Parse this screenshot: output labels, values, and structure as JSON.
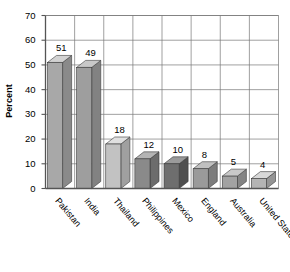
{
  "chart_data": {
    "type": "bar",
    "title": "",
    "subtitle": "",
    "xlabel": "",
    "ylabel": "Percent",
    "categories": [
      "Pakistan",
      "India",
      "Thailand",
      "Philippines",
      "Mexico",
      "England",
      "Australia",
      "United States"
    ],
    "values": [
      51,
      49,
      18,
      12,
      10,
      8,
      5,
      4
    ],
    "value_labels": [
      "51",
      "49",
      "18",
      "12",
      "10",
      "8",
      "5",
      "4"
    ],
    "ylim": [
      0,
      70
    ],
    "ytick_labels": [
      "0",
      "10",
      "20",
      "30",
      "40",
      "50",
      "60",
      "70"
    ],
    "ytick_values": [
      0,
      10,
      20,
      30,
      40,
      50,
      60,
      70
    ],
    "grid": true,
    "grid_axis": "both",
    "legend": false,
    "legend_position": "none",
    "style": "3d-bar-grayscale",
    "bar_face_colors": [
      "#a8a8a8",
      "#9e9e9e",
      "#c2c2c2",
      "#8a8a8a",
      "#6e6e6e",
      "#9a9a9a",
      "#a2a2a2",
      "#b4b4b4"
    ],
    "bar_top_colors": [
      "#d2d2d2",
      "#c8c8c8",
      "#e0e0e0",
      "#b4b4b4",
      "#9a9a9a",
      "#c0c0c0",
      "#c8c8c8",
      "#d8d8d8"
    ],
    "bar_side_colors": [
      "#8a8a8a",
      "#828282",
      "#a0a0a0",
      "#6c6c6c",
      "#505050",
      "#7c7c7c",
      "#848484",
      "#949494"
    ],
    "axis_color": "#555555",
    "grid_color": "#777777",
    "text_color": "#000000",
    "background_color": "#ffffff"
  }
}
